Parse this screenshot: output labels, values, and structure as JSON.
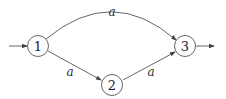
{
  "diagram": {
    "type": "finite-automaton",
    "nodes": [
      {
        "id": "1",
        "label": "1",
        "initial": true,
        "final": false
      },
      {
        "id": "2",
        "label": "2",
        "initial": false,
        "final": false
      },
      {
        "id": "3",
        "label": "3",
        "initial": false,
        "final": true
      }
    ],
    "edges": [
      {
        "from": "1",
        "to": "3",
        "label": "a"
      },
      {
        "from": "1",
        "to": "2",
        "label": "a"
      },
      {
        "from": "2",
        "to": "3",
        "label": "a"
      }
    ],
    "colors": {
      "stroke": "#555555",
      "text": "#222222",
      "background": "#ffffff"
    }
  }
}
